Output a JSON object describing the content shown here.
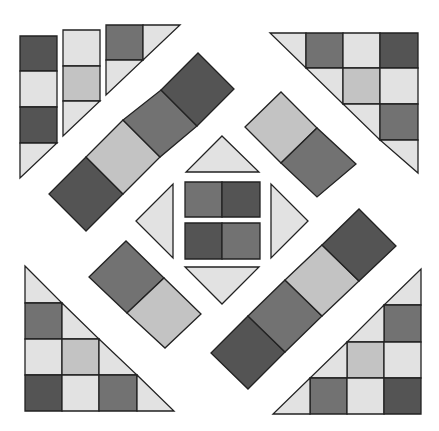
{
  "diagram": {
    "palette": {
      "D": "#545454",
      "M": "#727272",
      "S": "#c3c3c3",
      "L": "#e2e2e2",
      "background": "#ffffff",
      "stroke": "#222222"
    },
    "pieces": [
      {
        "name": "top-left-strip-1-square-1",
        "shade": "D",
        "points": "20,36 57,36 57,71 20,71"
      },
      {
        "name": "top-left-strip-1-square-2",
        "shade": "L",
        "points": "20,71 57,71 57,107 20,107"
      },
      {
        "name": "top-left-strip-1-square-3",
        "shade": "D",
        "points": "20,107 57,107 57,143 20,143"
      },
      {
        "name": "top-left-strip-1-triangle",
        "shade": "L",
        "points": "20,143 57,143 20,178"
      },
      {
        "name": "top-left-strip-2-square-1",
        "shade": "L",
        "points": "63,30 100,30 100,66 63,66"
      },
      {
        "name": "top-left-strip-2-square-2",
        "shade": "S",
        "points": "63,66 100,66 100,101 63,101"
      },
      {
        "name": "top-left-strip-2-triangle",
        "shade": "L",
        "points": "63,101 100,101 63,136"
      },
      {
        "name": "top-left-corner-square",
        "shade": "M",
        "points": "106,25 143,25 143,60 106,60"
      },
      {
        "name": "top-left-corner-triangle-right",
        "shade": "L",
        "points": "143,25 180,25 143,60"
      },
      {
        "name": "top-left-corner-triangle-bottom",
        "shade": "L",
        "points": "106,60 143,60 106,95"
      },
      {
        "name": "top-left-diagonal-square-1",
        "shade": "D",
        "points": "86,231 49,194 86,157 123,194"
      },
      {
        "name": "top-left-diagonal-square-2",
        "shade": "S",
        "points": "123,194 86,157 123,120 160,157"
      },
      {
        "name": "top-left-diagonal-square-3",
        "shade": "M",
        "points": "160,157 123,120 161,90 197,126"
      },
      {
        "name": "top-left-diagonal-square-4",
        "shade": "D",
        "points": "197,126 161,90 198,53 234,89"
      },
      {
        "name": "top-right-diagonal-square-1",
        "shade": "S",
        "points": "245,127 281,92 317,128 281,163"
      },
      {
        "name": "top-right-diagonal-square-2",
        "shade": "M",
        "points": "281,163 317,128 356,164 317,197"
      },
      {
        "name": "top-right-triangle-tri-1",
        "shade": "L",
        "points": "270,33 306,33 306,68"
      },
      {
        "name": "top-right-triangle-r1c1",
        "shade": "M",
        "points": "306,33 343,33 343,68 306,68"
      },
      {
        "name": "top-right-triangle-r1c2",
        "shade": "L",
        "points": "343,33 380,33 380,68 343,68"
      },
      {
        "name": "top-right-triangle-r1c3",
        "shade": "D",
        "points": "380,33 418,33 418,68 380,68"
      },
      {
        "name": "top-right-triangle-tri-2",
        "shade": "L",
        "points": "306,68 343,68 343,104"
      },
      {
        "name": "top-right-triangle-r2c2",
        "shade": "S",
        "points": "343,68 380,68 380,104 343,104"
      },
      {
        "name": "top-right-triangle-r2c3",
        "shade": "L",
        "points": "380,68 418,68 418,104 380,104"
      },
      {
        "name": "top-right-triangle-tri-3",
        "shade": "L",
        "points": "343,104 380,104 380,140"
      },
      {
        "name": "top-right-triangle-r3c3",
        "shade": "M",
        "points": "380,104 418,104 418,140 380,140"
      },
      {
        "name": "top-right-triangle-tri-4",
        "shade": "L",
        "points": "380,140 418,140 418,173"
      },
      {
        "name": "center-triangle-top",
        "shade": "L",
        "points": "222,136 259,172 186,172"
      },
      {
        "name": "center-triangle-left",
        "shade": "L",
        "points": "136,221 173,184 173,258"
      },
      {
        "name": "center-triangle-right",
        "shade": "L",
        "points": "308,221 271,258 271,184"
      },
      {
        "name": "center-triangle-bottom",
        "shade": "L",
        "points": "185,267 259,267 222,304"
      },
      {
        "name": "center-square-top-left",
        "shade": "M",
        "points": "185,182 222,182 222,217 185,217"
      },
      {
        "name": "center-square-top-right",
        "shade": "D",
        "points": "222,182 260,182 260,217 222,217"
      },
      {
        "name": "center-square-bottom-left",
        "shade": "D",
        "points": "185,223 222,223 222,259 185,259"
      },
      {
        "name": "center-square-bottom-right",
        "shade": "M",
        "points": "222,223 260,223 260,259 222,259"
      },
      {
        "name": "bottom-left-diagonal-square-1",
        "shade": "M",
        "points": "89,277 126,241 164,278 127,313"
      },
      {
        "name": "bottom-left-diagonal-square-2",
        "shade": "S",
        "points": "127,313 164,278 201,314 165,348"
      },
      {
        "name": "bottom-left-triangle-tri-1",
        "shade": "L",
        "points": "25,266 62,303 25,303"
      },
      {
        "name": "bottom-left-triangle-r1c1",
        "shade": "M",
        "points": "25,303 62,303 62,339 25,339"
      },
      {
        "name": "bottom-left-triangle-tri-2",
        "shade": "L",
        "points": "62,303 99,339 62,339"
      },
      {
        "name": "bottom-left-triangle-r2c1",
        "shade": "L",
        "points": "25,339 62,339 62,375 25,375"
      },
      {
        "name": "bottom-left-triangle-r2c2",
        "shade": "S",
        "points": "62,339 99,339 99,375 62,375"
      },
      {
        "name": "bottom-left-triangle-tri-3",
        "shade": "L",
        "points": "99,339 137,375 99,375"
      },
      {
        "name": "bottom-left-triangle-r3c1",
        "shade": "D",
        "points": "25,375 62,375 62,411 25,411"
      },
      {
        "name": "bottom-left-triangle-r3c2",
        "shade": "L",
        "points": "62,375 99,375 99,411 62,411"
      },
      {
        "name": "bottom-left-triangle-r3c3",
        "shade": "M",
        "points": "99,375 137,375 137,411 99,411"
      },
      {
        "name": "bottom-left-triangle-tri-4",
        "shade": "L",
        "points": "137,375 174,411 137,411"
      },
      {
        "name": "bottom-right-diagonal-square-1",
        "shade": "D",
        "points": "211,353 248,316 285,352 248,389"
      },
      {
        "name": "bottom-right-diagonal-square-2",
        "shade": "M",
        "points": "248,316 285,280 322,316 285,352"
      },
      {
        "name": "bottom-right-diagonal-square-3",
        "shade": "S",
        "points": "285,280 322,245 359,281 322,316"
      },
      {
        "name": "bottom-right-diagonal-square-4",
        "shade": "D",
        "points": "322,245 359,209 396,246 359,281"
      },
      {
        "name": "bottom-right-triangle-tri-1",
        "shade": "L",
        "points": "421,269 421,305 384,305"
      },
      {
        "name": "bottom-right-triangle-r1c3",
        "shade": "M",
        "points": "384,305 421,305 421,342 384,342"
      },
      {
        "name": "bottom-right-triangle-tri-2",
        "shade": "L",
        "points": "384,305 384,342 347,342"
      },
      {
        "name": "bottom-right-triangle-r2c2",
        "shade": "S",
        "points": "347,342 384,342 384,378 347,378"
      },
      {
        "name": "bottom-right-triangle-r2c3",
        "shade": "L",
        "points": "384,342 421,342 421,378 384,378"
      },
      {
        "name": "bottom-right-triangle-tri-3",
        "shade": "L",
        "points": "347,342 347,378 310,378"
      },
      {
        "name": "bottom-right-triangle-r3c1",
        "shade": "M",
        "points": "310,378 347,378 347,414 310,414"
      },
      {
        "name": "bottom-right-triangle-r3c2",
        "shade": "L",
        "points": "347,378 384,378 384,414 347,414"
      },
      {
        "name": "bottom-right-triangle-r3c3",
        "shade": "D",
        "points": "384,378 421,378 421,414 384,414"
      },
      {
        "name": "bottom-right-triangle-tri-4",
        "shade": "L",
        "points": "310,378 310,414 273,414"
      }
    ]
  }
}
